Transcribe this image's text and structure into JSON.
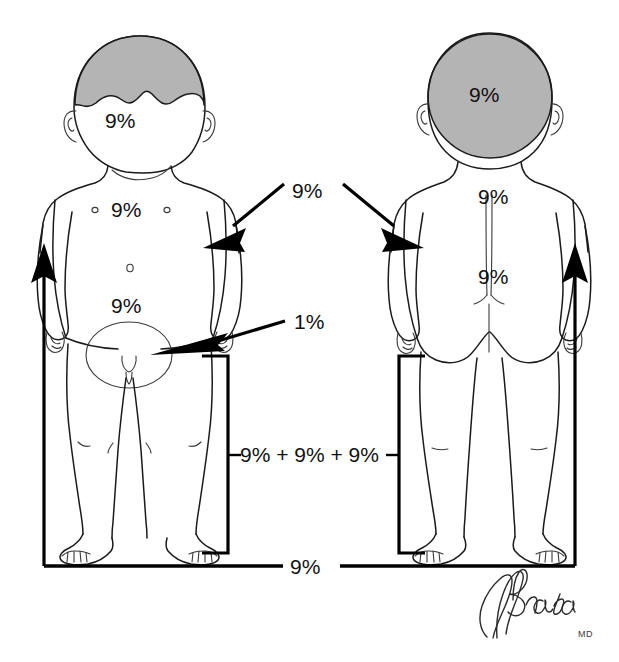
{
  "diagram": {
    "colors": {
      "ink": "#1a1a1a",
      "hair_gray": "#b4b4b4",
      "bracket_black": "#000000",
      "background": "#ffffff"
    }
  },
  "front_figure": {
    "name": "anterior-child-figure",
    "labels": {
      "head_face": "9%",
      "chest": "9%",
      "abdomen": "9%"
    }
  },
  "back_figure": {
    "name": "posterior-child-figure",
    "labels": {
      "head": "9%",
      "upper_back": "9%",
      "lower_back": "9%"
    }
  },
  "annotations": {
    "arms_label": "9%",
    "genitalia_label": "1%",
    "legs_sum_label": "9% + 9% + 9%",
    "legs_total_label": "9%"
  },
  "signature": {
    "name": "Brada",
    "credential": "MD"
  }
}
